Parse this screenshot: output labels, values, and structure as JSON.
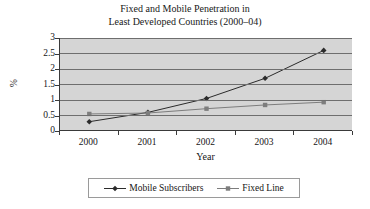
{
  "chart_data": {
    "type": "line",
    "title": "Fixed and Mobile Penetration in Least Developed Countries (2000–04)",
    "title_line1": "Fixed and Mobile Penetration in",
    "title_line2": "Least Developed Countries (2000–04)",
    "xlabel": "Year",
    "ylabel": "%",
    "categories": [
      "2000",
      "2001",
      "2002",
      "2003",
      "2004"
    ],
    "x": [
      2000,
      2001,
      2002,
      2003,
      2004
    ],
    "ylim": [
      0,
      3
    ],
    "yticks": [
      "0",
      "0.5",
      "1",
      "1.5",
      "2",
      "2.5",
      "3"
    ],
    "ytick_values": [
      0,
      0.5,
      1,
      1.5,
      2,
      2.5,
      3
    ],
    "grid": "horizontal",
    "legend_position": "bottom",
    "plot_background": "#d5d5d5",
    "series": [
      {
        "name": "Mobile Subscribers",
        "marker": "diamond",
        "color": "#2b2b2b",
        "values": [
          0.3,
          0.6,
          1.05,
          1.7,
          2.6
        ]
      },
      {
        "name": "Fixed Line",
        "marker": "square",
        "color": "#7d7d7d",
        "values": [
          0.55,
          0.58,
          0.72,
          0.84,
          0.93
        ]
      }
    ]
  }
}
